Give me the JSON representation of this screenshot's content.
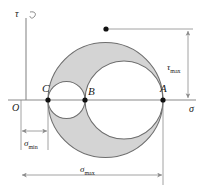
{
  "diagram": {
    "type": "mohr-circle",
    "axes": {
      "x_axis_label": "σ",
      "y_axis_label": "τ",
      "origin_label": "O"
    },
    "points": [
      {
        "label": "C",
        "x": 48,
        "y": 100,
        "role": "sigma-min-principal"
      },
      {
        "label": "B",
        "x": 85,
        "y": 100,
        "role": "sigma-intermediate-principal"
      },
      {
        "label": "A",
        "x": 163,
        "y": 100,
        "role": "sigma-max-principal"
      }
    ],
    "peak_point": {
      "x": 106,
      "y": 29,
      "role": "tau-max-point"
    },
    "circles": [
      {
        "name": "outer-circle-CA",
        "cx": 105.5,
        "cy": 100,
        "r": 57.5
      },
      {
        "name": "inner-circle-BA",
        "cx": 124.0,
        "cy": 100,
        "r": 39.0
      },
      {
        "name": "inner-circle-CB",
        "cx": 66.5,
        "cy": 100,
        "r": 18.5
      }
    ],
    "dimensions": [
      {
        "name": "tau-max",
        "label": "τ",
        "sub": "max",
        "orientation": "vertical",
        "x": 188,
        "y1": 29,
        "y2": 100
      },
      {
        "name": "sigma-min",
        "label": "σ",
        "sub": "min",
        "orientation": "horizontal",
        "y": 138,
        "x1": 21,
        "x2": 48
      },
      {
        "name": "sigma-max",
        "label": "σ",
        "sub": "max",
        "orientation": "horizontal",
        "y": 175,
        "x1": 21,
        "x2": 163
      }
    ],
    "colors": {
      "shaded_fill": "#d4d4d4",
      "stroke": "#6e6e6e",
      "axis": "#8a8a8a",
      "text": "#1a1a1a",
      "background": "#ffffff"
    }
  }
}
